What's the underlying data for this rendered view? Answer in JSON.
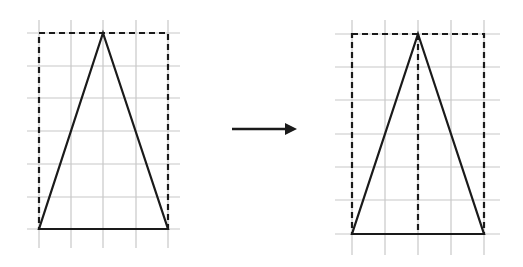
{
  "diagram": {
    "colors": {
      "grid": "#c8c8c8",
      "shape": "#1a1a1a",
      "background": "#ffffff"
    },
    "left_figure": {
      "name": "original",
      "grid": {
        "x_lines": [
          39,
          71,
          103,
          136,
          168
        ],
        "y_lines": [
          33,
          66,
          98,
          131,
          164,
          197,
          229
        ],
        "x_extent": [
          27,
          180
        ],
        "y_extent": [
          20,
          248
        ]
      },
      "rectangle": {
        "x1": 39,
        "y1": 33,
        "x2": 168,
        "y2": 229,
        "style": "dashed"
      },
      "triangle": {
        "apex": [
          103,
          33
        ],
        "base_left": [
          39,
          229
        ],
        "base_right": [
          168,
          229
        ]
      },
      "altitude": null
    },
    "arrow": {
      "x1": 232,
      "y1": 129,
      "x2": 297,
      "y2": 129,
      "direction": "right"
    },
    "right_figure": {
      "name": "transformed",
      "grid": {
        "x_lines": [
          352,
          385,
          418,
          451,
          484
        ],
        "y_lines": [
          34,
          67,
          100,
          134,
          167,
          200,
          234
        ],
        "x_extent": [
          335,
          500
        ],
        "y_extent": [
          20,
          255
        ]
      },
      "rectangle": {
        "x1": 352,
        "y1": 34,
        "x2": 484,
        "y2": 234,
        "style": "dashed"
      },
      "triangle": {
        "apex": [
          418,
          34
        ],
        "base_left": [
          352,
          234
        ],
        "base_right": [
          484,
          234
        ]
      },
      "altitude": {
        "x": 418,
        "y1": 34,
        "y2": 234,
        "style": "dashed"
      }
    }
  }
}
